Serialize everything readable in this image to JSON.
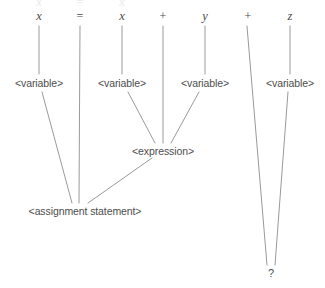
{
  "diagram": {
    "type": "parse-tree",
    "canvas": {
      "width": 325,
      "height": 288
    },
    "colors": {
      "background": "#ffffff",
      "edge": "#9a9a9a",
      "text": "#4d4d4d",
      "ghost": "#e9e9ec"
    },
    "tokens": [
      {
        "id": "tok-x1",
        "label": "x",
        "kind": "identifier",
        "x": 39,
        "y": 16
      },
      {
        "id": "tok-eq",
        "label": "=",
        "kind": "operator",
        "x": 80,
        "y": 16
      },
      {
        "id": "tok-x2",
        "label": "x",
        "kind": "identifier",
        "x": 122,
        "y": 16
      },
      {
        "id": "tok-plus1",
        "label": "+",
        "kind": "operator",
        "x": 163,
        "y": 16
      },
      {
        "id": "tok-y",
        "label": "y",
        "kind": "identifier",
        "x": 205,
        "y": 16
      },
      {
        "id": "tok-plus2",
        "label": "+",
        "kind": "operator",
        "x": 248,
        "y": 16
      },
      {
        "id": "tok-z",
        "label": "z",
        "kind": "identifier",
        "x": 290,
        "y": 16
      }
    ],
    "nonterminals": [
      {
        "id": "var-1",
        "label": "<variable>",
        "x": 39,
        "y": 83
      },
      {
        "id": "var-2",
        "label": "<variable>",
        "x": 122,
        "y": 83
      },
      {
        "id": "var-3",
        "label": "<variable>",
        "x": 205,
        "y": 83
      },
      {
        "id": "var-4",
        "label": "<variable>",
        "x": 290,
        "y": 83
      },
      {
        "id": "expr-1",
        "label": "<expression>",
        "x": 163,
        "y": 151
      },
      {
        "id": "assign-1",
        "label": "<assignment statement>",
        "x": 85,
        "y": 211
      },
      {
        "id": "unknown-1",
        "label": "?",
        "x": 271,
        "y": 273
      }
    ],
    "edges": [
      {
        "id": "edge-x1-var1",
        "from": "tok-x1",
        "to": "var-1",
        "x1": 39,
        "y1": 26,
        "x2": 39,
        "y2": 74
      },
      {
        "id": "edge-x2-var2",
        "from": "tok-x2",
        "to": "var-2",
        "x1": 122,
        "y1": 26,
        "x2": 122,
        "y2": 74
      },
      {
        "id": "edge-y-var3",
        "from": "tok-y",
        "to": "var-3",
        "x1": 205,
        "y1": 26,
        "x2": 205,
        "y2": 74
      },
      {
        "id": "edge-z-var4",
        "from": "tok-z",
        "to": "var-4",
        "x1": 290,
        "y1": 26,
        "x2": 290,
        "y2": 74
      },
      {
        "id": "edge-eq-assign",
        "from": "tok-eq",
        "to": "assign-1",
        "x1": 80,
        "y1": 26,
        "x2": 79,
        "y2": 203
      },
      {
        "id": "edge-plus1-expr",
        "from": "tok-plus1",
        "to": "expr-1",
        "x1": 163,
        "y1": 26,
        "x2": 163,
        "y2": 143
      },
      {
        "id": "edge-plus2-unknown",
        "from": "tok-plus2",
        "to": "unknown-1",
        "x1": 247,
        "y1": 26,
        "x2": 267,
        "y2": 265
      },
      {
        "id": "edge-var1-assign",
        "from": "var-1",
        "to": "assign-1",
        "x1": 42,
        "y1": 92,
        "x2": 72,
        "y2": 203
      },
      {
        "id": "edge-var2-expr",
        "from": "var-2",
        "to": "expr-1",
        "x1": 128,
        "y1": 92,
        "x2": 155,
        "y2": 143
      },
      {
        "id": "edge-var3-expr",
        "from": "var-3",
        "to": "expr-1",
        "x1": 199,
        "y1": 92,
        "x2": 171,
        "y2": 143
      },
      {
        "id": "edge-var4-unknown",
        "from": "var-4",
        "to": "unknown-1",
        "x1": 288,
        "y1": 92,
        "x2": 275,
        "y2": 265
      },
      {
        "id": "edge-expr-assign",
        "from": "expr-1",
        "to": "assign-1",
        "x1": 152,
        "y1": 158,
        "x2": 88,
        "y2": 203
      }
    ],
    "ghost_row": [
      {
        "id": "ghost-1",
        "label": "x",
        "x": 39,
        "y": 2
      },
      {
        "id": "ghost-2",
        "label": "=",
        "x": 80,
        "y": 2
      },
      {
        "id": "ghost-3",
        "label": "x",
        "x": 122,
        "y": 2
      }
    ]
  }
}
